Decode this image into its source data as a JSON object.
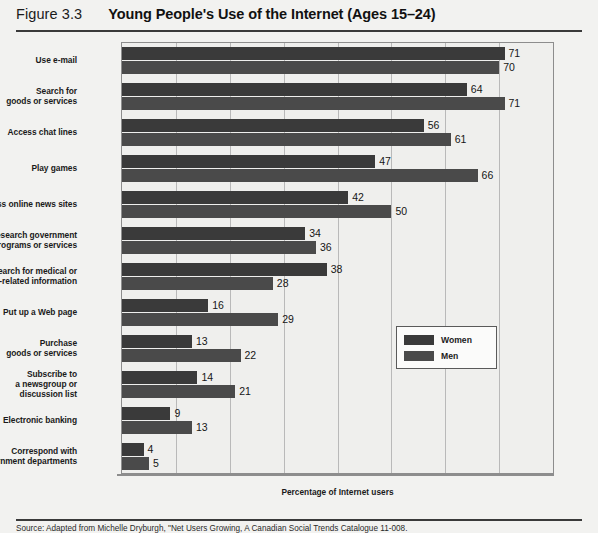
{
  "figure": {
    "number": "Figure 3.3",
    "title": "Young People's Use of the Internet (Ages 15–24)"
  },
  "source_note": "Source: Adapted from Michelle Dryburgh, \"Net Users Growing, A Canadian Social Trends Catalogue 11-008.",
  "legend": {
    "women_label": "Women",
    "men_label": "Men"
  },
  "chart_data": {
    "type": "bar",
    "orientation": "horizontal",
    "title": "Young People's Use of the Internet (Ages 15–24)",
    "xlabel": "Percentage of Internet users",
    "ylabel": "",
    "xlim": [
      0,
      80
    ],
    "xticks": [
      0,
      10,
      20,
      30,
      40,
      50,
      60,
      70,
      80
    ],
    "grid": true,
    "legend_position": "inside-right",
    "categories": [
      "Use e-mail",
      "Search for goods or services",
      "Access chat lines",
      "Play games",
      "Access online news sites",
      "Research government programs or services",
      "Search for medical or health-related information",
      "Put up a Web page",
      "Purchase goods or services",
      "Subscribe to a newsgroup or discussion list",
      "Electronic banking",
      "Correspond with government departments"
    ],
    "category_lines": [
      [
        "Use e-mail"
      ],
      [
        "Search for",
        "goods or services"
      ],
      [
        "Access chat lines"
      ],
      [
        "Play games"
      ],
      [
        "Access online news sites"
      ],
      [
        "Research government",
        "programs or services"
      ],
      [
        "Search for medical or",
        "health-related information"
      ],
      [
        "Put up a Web page"
      ],
      [
        "Purchase",
        "goods or services"
      ],
      [
        "Subscribe to",
        "a newsgroup or",
        "discussion list"
      ],
      [
        "Electronic banking"
      ],
      [
        "Correspond with",
        "government departments"
      ]
    ],
    "series": [
      {
        "name": "Women",
        "color": "#3a3a3a",
        "values": [
          71,
          64,
          56,
          47,
          42,
          34,
          38,
          16,
          13,
          14,
          9,
          4
        ]
      },
      {
        "name": "Men",
        "color": "#4a4a4a",
        "values": [
          70,
          71,
          61,
          66,
          50,
          36,
          28,
          29,
          22,
          21,
          13,
          5
        ]
      }
    ]
  }
}
